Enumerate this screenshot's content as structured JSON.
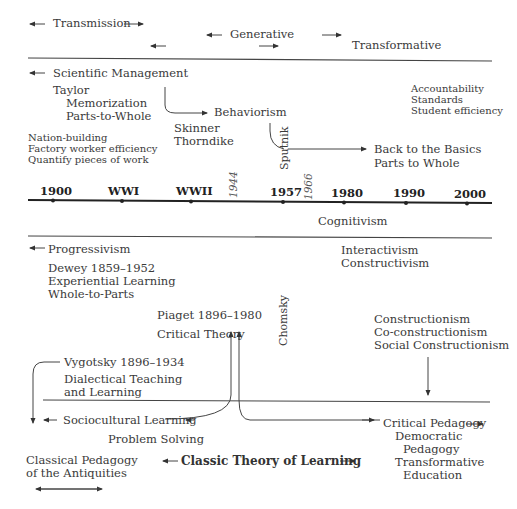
{
  "eras": {
    "transmission": "Transmission",
    "generative": "Generative",
    "transformative": "Transformative"
  },
  "upper": {
    "scientific_management": "Scientific Management",
    "taylor": "Taylor",
    "memorization": "Memorization",
    "parts_to_whole": "Parts-to-Whole",
    "nation_building": "Nation-building",
    "factory_efficiency": "Factory worker efficiency",
    "quantify": "Quantify pieces of work",
    "behaviorism": "Behaviorism",
    "skinner": "Skinner",
    "thorndike": "Thorndike",
    "sputnik": "Sputnik",
    "back_to_basics": "Back to the Basics",
    "parts_to_whole_2": "Parts to Whole",
    "accountability": "Accountability",
    "standards": "Standards",
    "student_efficiency": "Student efficiency"
  },
  "timeline": {
    "markers": [
      "1900",
      "WWI",
      "WWII",
      "1957",
      "1980",
      "1990",
      "2000"
    ],
    "italic_years": [
      "1944",
      "1966"
    ],
    "cognitivism": "Cognitivism"
  },
  "lower": {
    "progressivism": "Progressivism",
    "dewey": "Dewey 1859–1952",
    "experiential": "Experiential Learning",
    "whole_to_parts": "Whole-to-Parts",
    "interactivism": "Interactivism",
    "constructivism": "Constructivism",
    "piaget": "Piaget 1896–1980",
    "critical_theory": "Critical Theory",
    "chomsky": "Chomsky",
    "constructionism": "Constructionism",
    "co_constructionism": "Co-constructionism",
    "social_constructionism": "Social Constructionism",
    "vygotsky": "Vygotsky 1896–1934",
    "dialectical_1": "Dialectical Teaching",
    "dialectical_2": "and Learning",
    "sociocultural": "Sociocultural Learning",
    "problem_solving": "Problem Solving",
    "critical_pedagogy": "Critical Pedagogy",
    "democratic": "Democratic",
    "pedagogy": "Pedagogy",
    "transformative": "Transformative",
    "education": "Education",
    "classical_1": "Classical Pedagogy",
    "classical_2": "of the Antiquities",
    "classic_theory": "Classic Theory of Learning"
  }
}
